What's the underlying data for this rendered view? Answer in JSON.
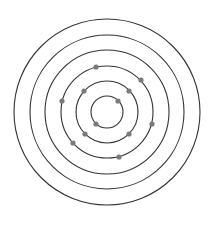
{
  "diagram": {
    "type": "atomic-shell-model",
    "center": [
      107,
      112
    ],
    "ring_color": "#333333",
    "electron_color": "#7a7a7a",
    "rings": [
      {
        "radius": 16,
        "electrons": [
          [
            118,
            101
          ],
          [
            96,
            124
          ]
        ]
      },
      {
        "radius": 31,
        "electrons": [
          [
            84,
            91
          ],
          [
            129,
            91
          ],
          [
            85,
            134
          ],
          [
            129,
            134
          ]
        ]
      },
      {
        "radius": 46,
        "electrons": [
          [
            96,
            67
          ],
          [
            141,
            80
          ],
          [
            62,
            101
          ],
          [
            152,
            124
          ],
          [
            73,
            143
          ],
          [
            119,
            157
          ]
        ]
      },
      {
        "radius": 62,
        "electrons": []
      },
      {
        "radius": 77,
        "electrons": []
      },
      {
        "radius": 93,
        "electrons": []
      }
    ]
  }
}
